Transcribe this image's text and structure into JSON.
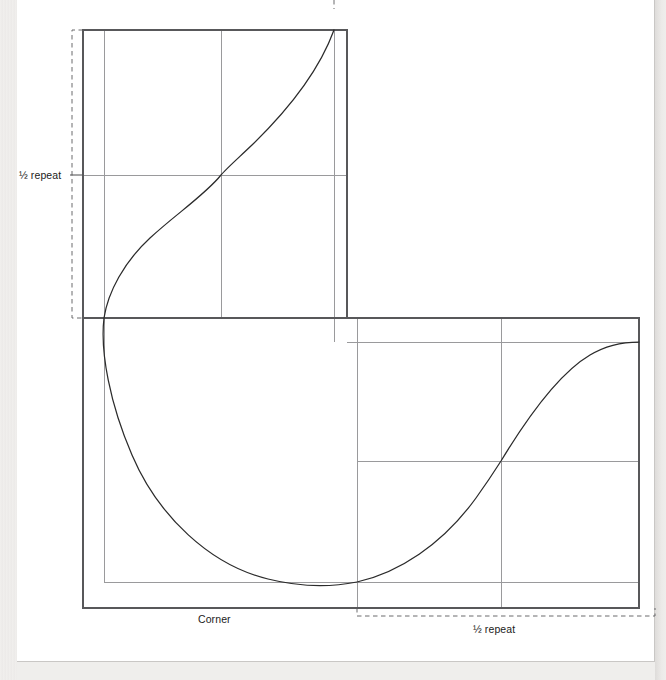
{
  "figure": {
    "type": "technical-drawing",
    "labels": {
      "half_repeat_left": "½ repeat",
      "corner": "Corner",
      "half_repeat_bottom": "½ repeat"
    },
    "colors": {
      "page": "#ffffff",
      "background": "#efeeec",
      "frame_stroke": "#58585a",
      "grid_stroke": "#9a9a9c",
      "curve_stroke": "#2b2b2b",
      "dash_stroke": "#6b6b6d",
      "text": "#1b1b1b"
    },
    "geometry": {
      "upper_box": {
        "x1": 83,
        "y1": 30,
        "x2": 347,
        "y2": 318
      },
      "lower_box": {
        "x1": 83,
        "y1": 318,
        "x2": 639,
        "y2": 608
      },
      "grid_vertical": [
        104,
        221,
        334,
        357,
        501
      ],
      "grid_horizontal": [
        175,
        318,
        342,
        461,
        582
      ],
      "dash_bracket_left": {
        "x": 72,
        "y1": 30,
        "y2": 318
      },
      "dash_bracket_bottom": {
        "y": 616,
        "x1": 357,
        "x2": 655
      },
      "top_partial_mark": {
        "x": 334,
        "y1": 0,
        "y2": 10
      }
    },
    "curve_points": [
      {
        "x": 334,
        "y": 30,
        "note": "top terminus at grid line"
      },
      {
        "x": 221,
        "y": 175,
        "note": "crosses half-repeat intersection"
      },
      {
        "x": 104,
        "y": 318,
        "note": "crosses corner intersection"
      },
      {
        "x": 357,
        "y": 582,
        "note": "minimum, tangent to lower grid line"
      },
      {
        "x": 501,
        "y": 461,
        "note": "crosses lower-right intersection"
      },
      {
        "x": 639,
        "y": 342,
        "note": "right terminus, tangent to grid line"
      }
    ]
  }
}
